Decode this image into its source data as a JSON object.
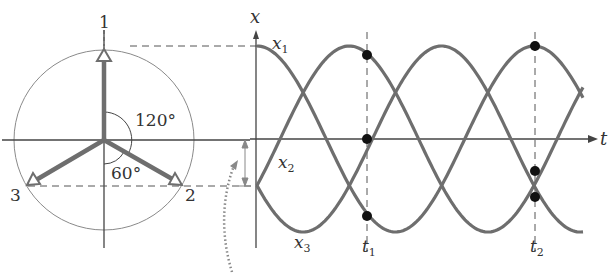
{
  "phasor": {
    "labels": [
      "1",
      "2",
      "3"
    ],
    "angle_top": "120°",
    "angle_bottom": "60°"
  },
  "graph": {
    "y_axis_label": "x",
    "x_axis_label": "t",
    "curves": [
      {
        "name": "x",
        "sub": "1"
      },
      {
        "name": "x",
        "sub": "2"
      },
      {
        "name": "x",
        "sub": "3"
      }
    ],
    "times": [
      {
        "name": "t",
        "sub": "1"
      },
      {
        "name": "t",
        "sub": "2"
      }
    ]
  },
  "colors": {
    "curve": "#6e6e6e",
    "axis": "#444444",
    "circle": "#8a8a8a",
    "dots": "#111111"
  }
}
